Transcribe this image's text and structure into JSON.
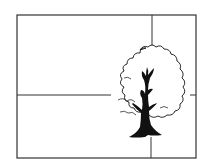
{
  "diagram": {
    "type": "rule-of-thirds composition",
    "frame": {
      "x": 17,
      "y": 15,
      "width": 179,
      "height": 143,
      "stroke": "#333333"
    },
    "grid_lines": {
      "vertical_x": 152,
      "horizontal_y": 95,
      "stroke": "#333333"
    },
    "subject": {
      "icon": "tree-icon",
      "position": "right third, intersecting grid lines",
      "canopy": {
        "cx": 151,
        "cy": 86,
        "rx": 41,
        "ry": 42
      },
      "trunk_base_y": 137
    }
  }
}
